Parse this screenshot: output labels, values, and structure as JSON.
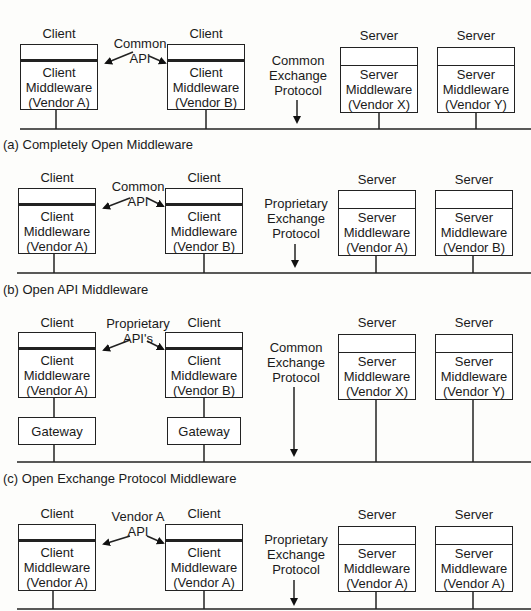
{
  "panels": [
    {
      "id": "a",
      "caption": "(a) Completely Open Middleware",
      "api_label": [
        "Common",
        "API"
      ],
      "protocol_label": [
        "Common",
        "Exchange",
        "Protocol"
      ],
      "clients": [
        {
          "title": "Client",
          "lines": [
            "Client",
            "Middleware",
            "(Vendor A)"
          ]
        },
        {
          "title": "Client",
          "lines": [
            "Client",
            "Middleware",
            "(Vendor B)"
          ]
        }
      ],
      "servers": [
        {
          "title": "Server",
          "lines": [
            "Server",
            "Middleware",
            "(Vendor X)"
          ]
        },
        {
          "title": "Server",
          "lines": [
            "Server",
            "Middleware",
            "(Vendor Y)"
          ]
        }
      ]
    },
    {
      "id": "b",
      "caption": "(b) Open API Middleware",
      "api_label": [
        "Common",
        "API"
      ],
      "protocol_label": [
        "Proprietary",
        "Exchange",
        "Protocol"
      ],
      "clients": [
        {
          "title": "Client",
          "lines": [
            "Client",
            "Middleware",
            "(Vendor A)"
          ]
        },
        {
          "title": "Client",
          "lines": [
            "Client",
            "Middleware",
            "(Vendor B)"
          ]
        }
      ],
      "servers": [
        {
          "title": "Server",
          "lines": [
            "Server",
            "Middleware",
            "(Vendor A)"
          ]
        },
        {
          "title": "Server",
          "lines": [
            "Server",
            "Middleware",
            "(Vendor B)"
          ]
        }
      ]
    },
    {
      "id": "c",
      "caption": "(c) Open Exchange Protocol Middleware",
      "api_label": [
        "Proprietary",
        "API's"
      ],
      "protocol_label": [
        "Common",
        "Exchange",
        "Protocol"
      ],
      "gateway_label": "Gateway",
      "clients": [
        {
          "title": "Client",
          "lines": [
            "Client",
            "Middleware",
            "(Vendor A)"
          ]
        },
        {
          "title": "Client",
          "lines": [
            "Client",
            "Middleware",
            "(Vendor B)"
          ]
        }
      ],
      "servers": [
        {
          "title": "Server",
          "lines": [
            "Server",
            "Middleware",
            "(Vendor X)"
          ]
        },
        {
          "title": "Server",
          "lines": [
            "Server",
            "Middleware",
            "(Vendor Y)"
          ]
        }
      ]
    },
    {
      "id": "d",
      "caption": "",
      "api_label": [
        "Vendor A",
        "API"
      ],
      "protocol_label": [
        "Proprietary",
        "Exchange",
        "Protocol"
      ],
      "clients": [
        {
          "title": "Client",
          "lines": [
            "Client",
            "Middleware",
            "(Vendor A)"
          ]
        },
        {
          "title": "Client",
          "lines": [
            "Client",
            "Middleware",
            "(Vendor A)"
          ]
        }
      ],
      "servers": [
        {
          "title": "Server",
          "lines": [
            "Server",
            "Middleware",
            "(Vendor A)"
          ]
        },
        {
          "title": "Server",
          "lines": [
            "Server",
            "Middleware",
            "(Vendor A)"
          ]
        }
      ]
    }
  ]
}
